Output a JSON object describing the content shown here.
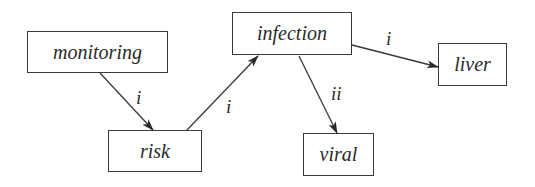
{
  "diagram": {
    "nodes": [
      {
        "id": "monitoring",
        "label": "monitoring",
        "x": 27,
        "y": 31,
        "w": 141,
        "h": 42
      },
      {
        "id": "risk",
        "label": "risk",
        "x": 108,
        "y": 130,
        "w": 94,
        "h": 42
      },
      {
        "id": "infection",
        "label": "infection",
        "x": 232,
        "y": 12,
        "w": 120,
        "h": 43
      },
      {
        "id": "viral",
        "label": "viral",
        "x": 303,
        "y": 133,
        "w": 71,
        "h": 43
      },
      {
        "id": "liver",
        "label": "liver",
        "x": 438,
        "y": 43,
        "w": 69,
        "h": 43
      }
    ],
    "edges": [
      {
        "from": "monitoring",
        "to": "risk",
        "label": "i"
      },
      {
        "from": "risk",
        "to": "infection",
        "label": "i"
      },
      {
        "from": "infection",
        "to": "viral",
        "label": "ii"
      },
      {
        "from": "infection",
        "to": "liver",
        "label": "i"
      }
    ],
    "colors": {
      "stroke": "#3a3a3a",
      "text": "#2a2a2a",
      "background": "#ffffff"
    }
  }
}
